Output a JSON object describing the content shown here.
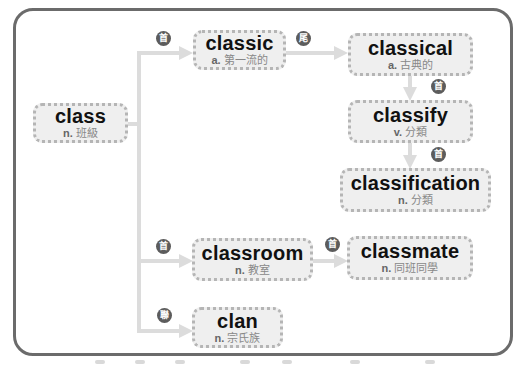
{
  "diagram": {
    "colors": {
      "frame": "#6b6b6b",
      "node_bg": "#efefef",
      "node_border": "#b5b5b5",
      "connector": "#dcdcdc",
      "badge": "#5c5c5c"
    },
    "nodes": {
      "class": {
        "word": "class",
        "pos": "n.",
        "meaning": "班級"
      },
      "classic": {
        "word": "classic",
        "pos": "a.",
        "meaning": "第一流的"
      },
      "classical": {
        "word": "classical",
        "pos": "a.",
        "meaning": "古典的"
      },
      "classify": {
        "word": "classify",
        "pos": "v.",
        "meaning": "分類"
      },
      "classification": {
        "word": "classification",
        "pos": "n.",
        "meaning": "分類"
      },
      "classroom": {
        "word": "classroom",
        "pos": "n.",
        "meaning": "教室"
      },
      "classmate": {
        "word": "classmate",
        "pos": "n.",
        "meaning": "同班同學"
      },
      "clan": {
        "word": "clan",
        "pos": "n.",
        "meaning": "宗氏族"
      }
    },
    "badges": {
      "class_to_classic": "首",
      "classic_to_classical": "尾",
      "classical_to_classify": "首",
      "classify_to_classification": "首",
      "class_to_classroom": "首",
      "classroom_to_classmate": "首",
      "class_to_clan": "聯"
    },
    "edges": [
      {
        "from": "class",
        "to": "classic",
        "badge": "首"
      },
      {
        "from": "classic",
        "to": "classical",
        "badge": "尾"
      },
      {
        "from": "classical",
        "to": "classify",
        "badge": "首"
      },
      {
        "from": "classify",
        "to": "classification",
        "badge": "首"
      },
      {
        "from": "class",
        "to": "classroom",
        "badge": "首"
      },
      {
        "from": "classroom",
        "to": "classmate",
        "badge": "首"
      },
      {
        "from": "class",
        "to": "clan",
        "badge": "聯"
      }
    ]
  }
}
